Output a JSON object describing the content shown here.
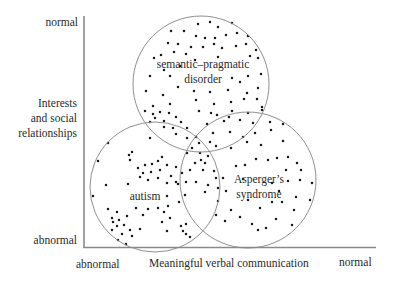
{
  "diagram": {
    "y_axis": {
      "label_lines": [
        "Interests",
        "and social",
        "relationships"
      ],
      "top_label": "normal",
      "bottom_label": "abnormal"
    },
    "x_axis": {
      "label": "Meaningful verbal communication",
      "left_label": "abnormal",
      "right_label": "normal"
    },
    "regions": [
      {
        "name": "semantic-pragmatic disorder",
        "label_lines": [
          "semantic–pragmatic",
          "disorder"
        ],
        "cx": 201,
        "cy": 84,
        "r": 68
      },
      {
        "name": "autism",
        "label_lines": [
          "autism"
        ],
        "cx": 155,
        "cy": 187,
        "r": 65
      },
      {
        "name": "Asperger's syndrome",
        "label_lines": [
          "Asperger’s",
          "syndrome"
        ],
        "cx": 248,
        "cy": 180,
        "r": 68
      }
    ],
    "colors": {
      "axis": "#8a8a8a",
      "circle": "#8f8f8f",
      "dot": "#1a1a1a",
      "text": "#2a2a2a"
    },
    "dots": [
      [
        198,
        24
      ],
      [
        210,
        22
      ],
      [
        218,
        27
      ],
      [
        232,
        23
      ],
      [
        171,
        31
      ],
      [
        184,
        31
      ],
      [
        196,
        36
      ],
      [
        205,
        38
      ],
      [
        215,
        38
      ],
      [
        226,
        35
      ],
      [
        237,
        33
      ],
      [
        248,
        36
      ],
      [
        168,
        43
      ],
      [
        178,
        44
      ],
      [
        191,
        47
      ],
      [
        203,
        47
      ],
      [
        214,
        44
      ],
      [
        222,
        48
      ],
      [
        236,
        46
      ],
      [
        246,
        44
      ],
      [
        256,
        50
      ],
      [
        161,
        55
      ],
      [
        174,
        52
      ],
      [
        186,
        54
      ],
      [
        195,
        60
      ],
      [
        218,
        57
      ],
      [
        250,
        56
      ],
      [
        258,
        58
      ],
      [
        154,
        58
      ],
      [
        150,
        76
      ],
      [
        164,
        70
      ],
      [
        170,
        76
      ],
      [
        180,
        66
      ],
      [
        232,
        78
      ],
      [
        240,
        82
      ],
      [
        248,
        76
      ],
      [
        261,
        74
      ],
      [
        146,
        91
      ],
      [
        163,
        95
      ],
      [
        178,
        87
      ],
      [
        194,
        91
      ],
      [
        210,
        92
      ],
      [
        228,
        90
      ],
      [
        247,
        93
      ],
      [
        258,
        88
      ],
      [
        153,
        106
      ],
      [
        170,
        104
      ],
      [
        196,
        100
      ],
      [
        214,
        104
      ],
      [
        231,
        102
      ],
      [
        244,
        99
      ],
      [
        257,
        99
      ],
      [
        262,
        110
      ],
      [
        217,
        115
      ],
      [
        232,
        111
      ],
      [
        248,
        113
      ],
      [
        262,
        107
      ],
      [
        207,
        124
      ],
      [
        224,
        121
      ],
      [
        240,
        120
      ],
      [
        253,
        123
      ],
      [
        270,
        122
      ],
      [
        213,
        133
      ],
      [
        230,
        132
      ],
      [
        243,
        137
      ],
      [
        255,
        133
      ],
      [
        271,
        130
      ],
      [
        199,
        143
      ],
      [
        216,
        146
      ],
      [
        231,
        148
      ],
      [
        247,
        142
      ],
      [
        261,
        145
      ],
      [
        283,
        124
      ],
      [
        283,
        141
      ],
      [
        199,
        111
      ],
      [
        211,
        113
      ],
      [
        229,
        117
      ],
      [
        145,
        111
      ],
      [
        153,
        114
      ],
      [
        160,
        112
      ],
      [
        155,
        118
      ],
      [
        164,
        121
      ],
      [
        150,
        122
      ],
      [
        169,
        113
      ],
      [
        176,
        117
      ],
      [
        164,
        127
      ],
      [
        173,
        128
      ],
      [
        181,
        122
      ],
      [
        187,
        128
      ],
      [
        176,
        134
      ],
      [
        187,
        138
      ],
      [
        150,
        138
      ],
      [
        192,
        148
      ],
      [
        200,
        153
      ],
      [
        205,
        163
      ],
      [
        195,
        163
      ],
      [
        187,
        153
      ],
      [
        196,
        137
      ],
      [
        210,
        142
      ],
      [
        108,
        143
      ],
      [
        129,
        155
      ],
      [
        132,
        152
      ],
      [
        130,
        160
      ],
      [
        98,
        161
      ],
      [
        138,
        168
      ],
      [
        145,
        165
      ],
      [
        152,
        164
      ],
      [
        158,
        161
      ],
      [
        162,
        157
      ],
      [
        167,
        165
      ],
      [
        176,
        167
      ],
      [
        143,
        173
      ],
      [
        151,
        172
      ],
      [
        160,
        170
      ],
      [
        171,
        176
      ],
      [
        182,
        173
      ],
      [
        190,
        170
      ],
      [
        203,
        170
      ],
      [
        214,
        171
      ],
      [
        216,
        178
      ],
      [
        208,
        185
      ],
      [
        218,
        188
      ],
      [
        106,
        185
      ],
      [
        148,
        180
      ],
      [
        158,
        178
      ],
      [
        167,
        183
      ],
      [
        176,
        182
      ],
      [
        186,
        182
      ],
      [
        196,
        182
      ],
      [
        205,
        192
      ],
      [
        226,
        191
      ],
      [
        93,
        196
      ],
      [
        128,
        184
      ],
      [
        140,
        177
      ],
      [
        167,
        196
      ],
      [
        178,
        184
      ],
      [
        201,
        160
      ],
      [
        208,
        156
      ],
      [
        236,
        166
      ],
      [
        245,
        165
      ],
      [
        256,
        159
      ],
      [
        268,
        160
      ],
      [
        277,
        158
      ],
      [
        288,
        157
      ],
      [
        297,
        163
      ],
      [
        223,
        178
      ],
      [
        243,
        179
      ],
      [
        286,
        170
      ],
      [
        301,
        170
      ],
      [
        300,
        180
      ],
      [
        312,
        183
      ],
      [
        310,
        200
      ],
      [
        296,
        197
      ],
      [
        279,
        191
      ],
      [
        282,
        202
      ],
      [
        248,
        200
      ],
      [
        272,
        202
      ],
      [
        294,
        210
      ],
      [
        231,
        210
      ],
      [
        260,
        208
      ],
      [
        240,
        217
      ],
      [
        252,
        224
      ],
      [
        266,
        228
      ],
      [
        276,
        219
      ],
      [
        292,
        225
      ],
      [
        258,
        230
      ],
      [
        225,
        221
      ],
      [
        216,
        215
      ],
      [
        218,
        201
      ],
      [
        288,
        181
      ],
      [
        272,
        183
      ],
      [
        108,
        209
      ],
      [
        117,
        212
      ],
      [
        112,
        218
      ],
      [
        119,
        220
      ],
      [
        127,
        216
      ],
      [
        113,
        222
      ],
      [
        117,
        226
      ],
      [
        124,
        225
      ],
      [
        130,
        230
      ],
      [
        112,
        230
      ],
      [
        122,
        234
      ],
      [
        118,
        240
      ],
      [
        136,
        208
      ],
      [
        143,
        215
      ],
      [
        140,
        229
      ],
      [
        132,
        236
      ],
      [
        148,
        209
      ],
      [
        126,
        244
      ],
      [
        158,
        208
      ],
      [
        164,
        212
      ],
      [
        168,
        206
      ],
      [
        162,
        222
      ],
      [
        170,
        218
      ],
      [
        181,
        226
      ],
      [
        186,
        224
      ],
      [
        183,
        231
      ],
      [
        186,
        234
      ],
      [
        190,
        237
      ],
      [
        167,
        231
      ],
      [
        179,
        202
      ],
      [
        185,
        195
      ]
    ]
  }
}
